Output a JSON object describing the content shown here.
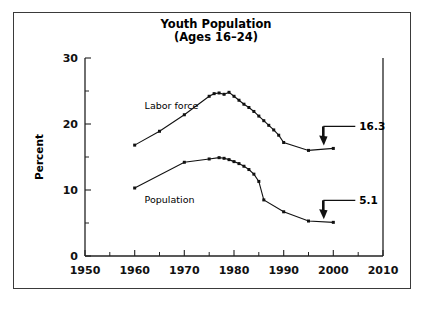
{
  "chart_data": {
    "type": "line",
    "title": "Youth Population",
    "subtitle": "(Ages 16–24)",
    "xlabel": "",
    "ylabel": "Percent",
    "xlim": [
      1950,
      2010
    ],
    "ylim": [
      0,
      30
    ],
    "x_ticks": [
      1950,
      1960,
      1970,
      1980,
      1990,
      2000,
      2010
    ],
    "x_tick_labels": [
      "1950",
      "1960",
      "1970",
      "1980",
      "1990",
      "2000",
      "2010"
    ],
    "x_minor_ticks": [
      1955,
      1965,
      1975,
      1985,
      1995,
      2005
    ],
    "y_ticks": [
      0,
      10,
      20,
      30
    ],
    "y_tick_labels": [
      "0",
      "10",
      "20",
      "30"
    ],
    "y_minor_ticks": [
      5,
      15,
      25
    ],
    "grid": false,
    "legend": "inline-labels",
    "series": [
      {
        "name": "Labor force",
        "label_x": 1962,
        "label_y": 22.3,
        "x": [
          1960,
          1965,
          1970,
          1975,
          1976,
          1977,
          1978,
          1979,
          1980,
          1981,
          1982,
          1983,
          1984,
          1985,
          1986,
          1987,
          1988,
          1989,
          1990,
          1995,
          2000
        ],
        "y": [
          16.8,
          18.9,
          21.4,
          24.2,
          24.6,
          24.7,
          24.5,
          24.8,
          24.2,
          23.6,
          23.0,
          22.5,
          21.9,
          21.2,
          20.5,
          19.8,
          19.1,
          18.3,
          17.2,
          16.0,
          16.3
        ]
      },
      {
        "name": "Population",
        "label_x": 1962,
        "label_y": 8.1,
        "x": [
          1960,
          1970,
          1975,
          1977,
          1978,
          1979,
          1980,
          1981,
          1982,
          1983,
          1984,
          1985,
          1986,
          1990,
          1995,
          2000
        ],
        "y": [
          10.3,
          14.2,
          14.7,
          14.9,
          14.8,
          14.6,
          14.3,
          14.0,
          13.6,
          13.1,
          12.4,
          11.3,
          8.5,
          6.7,
          5.3,
          5.1
        ]
      }
    ],
    "annotations": [
      {
        "text": "16.3",
        "target_x": 2000,
        "target_y": 16.3,
        "series": "Labor force"
      },
      {
        "text": "5.1",
        "target_x": 2000,
        "target_y": 5.1,
        "series": "Population"
      }
    ]
  },
  "colors": {
    "line": "#111111",
    "marker": "#111111",
    "axis": "#222222",
    "frame": "#3a3a3a",
    "background": "#ffffff"
  }
}
